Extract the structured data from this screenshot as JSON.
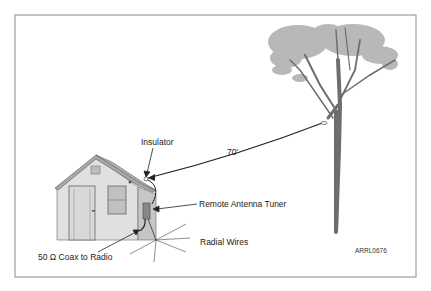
{
  "labels": {
    "insulator": "Insulator",
    "wire_length": "70'",
    "remote_tuner": "Remote Antenna Tuner",
    "radial_wires": "Radial Wires",
    "coax": "50 Ω Coax to Radio",
    "figure_id": "ARRL0676"
  },
  "colors": {
    "frame": "#8a8a8a",
    "house_wall": "#e2e2e2",
    "house_side": "#c8c8c8",
    "roof": "#a8a8a8",
    "foliage": "#b5b5b5",
    "trunk": "#707070",
    "wire": "#222222"
  }
}
